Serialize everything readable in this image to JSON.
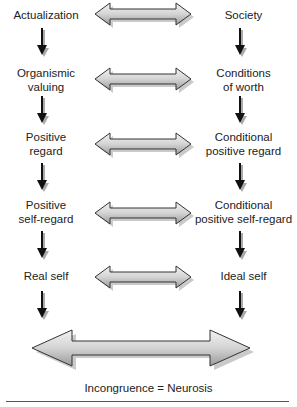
{
  "diagram": {
    "left_column": [
      {
        "label": "Actualization"
      },
      {
        "label": "Organismic\nvaluing"
      },
      {
        "label": "Positive\nregard"
      },
      {
        "label": "Positive\nself-regard"
      },
      {
        "label": "Real self"
      }
    ],
    "right_column": [
      {
        "label": "Society"
      },
      {
        "label": "Conditions\nof worth"
      },
      {
        "label": "Conditional\npositive regard"
      },
      {
        "label": "Conditional\npositive self-regard"
      },
      {
        "label": "Ideal self"
      }
    ],
    "connectors": {
      "horizontal": "double-headed-arrow",
      "vertical": "down-arrow",
      "final": "large-double-headed-arrow"
    },
    "caption": "Incongruence = Neurosis",
    "colors": {
      "arrow_fill": "#d9d9d9",
      "arrow_stroke": "#333333",
      "shadow": "#b0b0b0",
      "down_arrow": "#1a1a1a"
    }
  }
}
